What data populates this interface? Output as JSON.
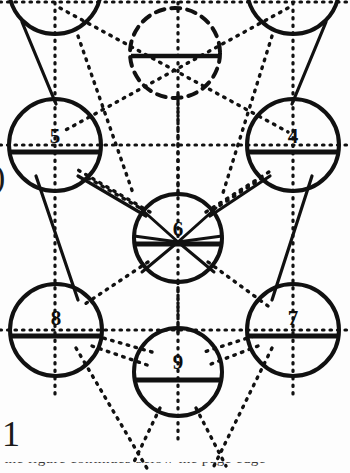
{
  "diagram": {
    "type": "tree-of-life",
    "width": 350,
    "height": 473,
    "background_color": "#fdfdfd",
    "ink_color": "#101010",
    "spheres": [
      {
        "id": "s2",
        "label": "",
        "cx": 55,
        "cy": -12,
        "r": 46,
        "style": "solid",
        "clipped": "top",
        "visible_label": false
      },
      {
        "id": "s3",
        "label": "",
        "cx": 293,
        "cy": -12,
        "r": 46,
        "style": "solid",
        "clipped": "top",
        "visible_label": false
      },
      {
        "id": "daath",
        "label": "",
        "cx": 175,
        "cy": 53,
        "r": 46,
        "style": "dashed",
        "clipped": "none",
        "visible_label": false
      },
      {
        "id": "s5",
        "label": "5",
        "cx": 55,
        "cy": 145,
        "r": 46,
        "style": "solid",
        "clipped": "none",
        "visible_label": true
      },
      {
        "id": "s4",
        "label": "4",
        "cx": 293,
        "cy": 145,
        "r": 46,
        "style": "solid",
        "clipped": "none",
        "visible_label": true
      },
      {
        "id": "s6",
        "label": "6",
        "cx": 178,
        "cy": 238,
        "r": 44,
        "style": "solid",
        "clipped": "none",
        "visible_label": true
      },
      {
        "id": "s8",
        "label": "8",
        "cx": 56,
        "cy": 330,
        "r": 46,
        "style": "solid",
        "clipped": "none",
        "visible_label": true
      },
      {
        "id": "s7",
        "label": "7",
        "cx": 293,
        "cy": 330,
        "r": 46,
        "style": "solid",
        "clipped": "none",
        "visible_label": true
      },
      {
        "id": "s9",
        "label": "9",
        "cx": 178,
        "cy": 372,
        "r": 44,
        "style": "solid",
        "clipped": "none",
        "visible_label": true
      }
    ],
    "labels_visible": [
      "5",
      "4",
      "6",
      "8",
      "7",
      "9"
    ],
    "paths_solid": [
      {
        "from": "s5",
        "to": "s6"
      },
      {
        "from": "s4",
        "to": "s6"
      },
      {
        "from": "s5",
        "to": "s8"
      },
      {
        "from": "s4",
        "to": "s7"
      },
      {
        "from": "s2",
        "to": "s5"
      },
      {
        "from": "s3",
        "to": "s4"
      }
    ],
    "paths_dotted": [
      {
        "from": "s2",
        "to": "s4"
      },
      {
        "from": "s3",
        "to": "s5"
      },
      {
        "from": "s5",
        "to": "s4"
      },
      {
        "from": "s8",
        "to": "s7"
      },
      {
        "from": "s6",
        "to": "s8"
      },
      {
        "from": "s6",
        "to": "s7"
      },
      {
        "from": "s6",
        "to": "s9"
      },
      {
        "from": "s8",
        "to": "s9"
      },
      {
        "from": "s7",
        "to": "s9"
      },
      {
        "from": "s9",
        "to": "s10"
      },
      {
        "from": "s8",
        "to": "s10"
      },
      {
        "from": "s7",
        "to": "s10"
      },
      {
        "from": "daath",
        "to": "s6"
      }
    ],
    "axis_lines": [
      {
        "orientation": "vertical",
        "x": 55,
        "note": "left pillar"
      },
      {
        "orientation": "vertical",
        "x": 178,
        "note": "middle pillar"
      },
      {
        "orientation": "vertical",
        "x": 293,
        "note": "right pillar"
      },
      {
        "orientation": "horizontal",
        "y": 145,
        "note": "row 4-5"
      },
      {
        "orientation": "horizontal",
        "y": 330,
        "note": "row 7-8"
      },
      {
        "orientation": "horizontal",
        "y": 2,
        "note": "top row"
      }
    ]
  },
  "margin": {
    "paren_glyph": ")",
    "page_numeral": "1",
    "caption_fragment": "the figure continues below the page edge"
  }
}
